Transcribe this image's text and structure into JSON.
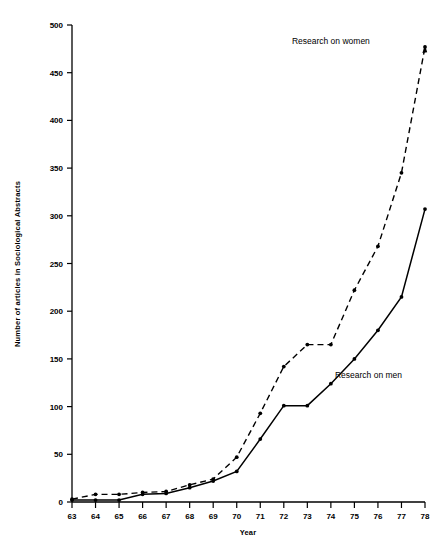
{
  "chart_data": {
    "type": "line",
    "title": "",
    "xlabel": "Year",
    "ylabel": "Number of articles in Sociological Abstracts",
    "x": [
      63,
      64,
      65,
      66,
      67,
      68,
      69,
      70,
      71,
      72,
      73,
      74,
      75,
      76,
      77,
      78
    ],
    "categories": [
      "63",
      "64",
      "65",
      "66",
      "67",
      "68",
      "69",
      "70",
      "71",
      "72",
      "73",
      "74",
      "75",
      "76",
      "77",
      "78"
    ],
    "xlim": [
      62.5,
      78.5
    ],
    "ylim": [
      0,
      500
    ],
    "xticks": [
      "63",
      "64",
      "65",
      "66",
      "67",
      "68",
      "69",
      "70",
      "71",
      "72",
      "73",
      "74",
      "75",
      "76",
      "77",
      "78"
    ],
    "yticks": [
      "0",
      "50",
      "100",
      "150",
      "200",
      "250",
      "300",
      "350",
      "400",
      "450",
      "500"
    ],
    "ytick_values": [
      0,
      50,
      100,
      150,
      200,
      250,
      300,
      350,
      400,
      450,
      500
    ],
    "grid": false,
    "legend": "annotations-on-plot",
    "series": [
      {
        "name": "Research on men",
        "style": "solid",
        "marker": "dot",
        "values": [
          2,
          2,
          2,
          8,
          9,
          15,
          22,
          32,
          66,
          101,
          101,
          124,
          150,
          180,
          215,
          307
        ]
      },
      {
        "name": "Research on women",
        "style": "dashed",
        "marker": "dot",
        "values": [
          3,
          8,
          8,
          10,
          11,
          18,
          24,
          47,
          93,
          142,
          165,
          165,
          222,
          268,
          345,
          477
        ]
      }
    ],
    "annotations": [
      {
        "text": "Research on women",
        "x": 74.0,
        "y": 480
      },
      {
        "text": "Research on men",
        "x": 75.6,
        "y": 130
      }
    ]
  },
  "colors": {
    "background": "#ffffff",
    "ink": "#000000",
    "axis": "#000000"
  }
}
